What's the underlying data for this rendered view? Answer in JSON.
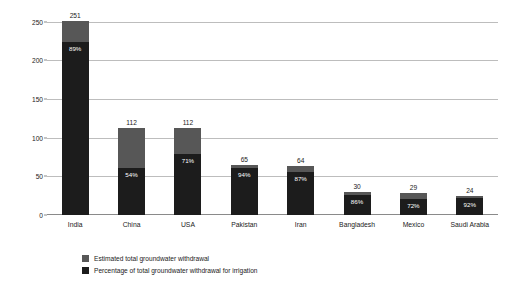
{
  "chart_data": {
    "type": "bar",
    "title": "",
    "xlabel": "",
    "ylabel": "Estimated total groundwater withdrawal (km",
    "ylabel_superscript": "3",
    "ylabel_suffix": ")",
    "ylim": [
      0,
      260
    ],
    "yticks": [
      0,
      50,
      100,
      150,
      200,
      250
    ],
    "grid": true,
    "legend_position": "bottom-left",
    "categories": [
      "India",
      "China",
      "USA",
      "Pakistan",
      "Iran",
      "Bangladesh",
      "Mexico",
      "Saudi Arabia"
    ],
    "series": [
      {
        "name": "Estimated total groundwater withdrawal",
        "color": "#575757",
        "values": [
          251,
          112,
          112,
          65,
          64,
          30,
          29,
          24
        ]
      },
      {
        "name": "Percentage of total groundwater withdrawal for irrigation",
        "color": "#1c1c1c",
        "values": [
          89,
          54,
          71,
          94,
          87,
          86,
          72,
          92
        ],
        "unit": "%"
      }
    ],
    "value_labels": [
      "251",
      "112",
      "112",
      "65",
      "64",
      "30",
      "29",
      "24"
    ],
    "percent_labels": [
      "89%",
      "54%",
      "71%",
      "94%",
      "87%",
      "86%",
      "72%",
      "92%"
    ]
  },
  "legend": {
    "items": [
      {
        "label": "Estimated total groundwater withdrawal",
        "color": "#575757"
      },
      {
        "label": "Percentage of total groundwater withdrawal for irrigation",
        "color": "#1c1c1c"
      }
    ]
  },
  "axis": {
    "y_tick_labels": [
      "0",
      "50",
      "100",
      "150",
      "200",
      "250"
    ]
  }
}
